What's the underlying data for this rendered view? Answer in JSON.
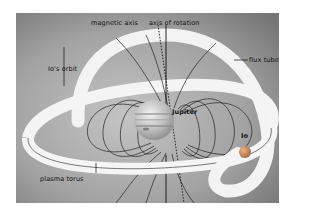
{
  "diagram": {
    "labels": {
      "magnetic_axis": "magnetic axis",
      "axis_of_rotation": "axis of rotation",
      "ios_orbit": "Io's orbit",
      "flux_tube": "flux tube",
      "jupiter": "Jupiter",
      "io": "Io",
      "plasma_torus": "plasma torus"
    },
    "colors": {
      "background_light": "#bdbdbd",
      "background_dark": "#7a7a7a",
      "torus": "#f4f4f4",
      "field_lines": "#222222",
      "io": "#c98a5a"
    }
  }
}
